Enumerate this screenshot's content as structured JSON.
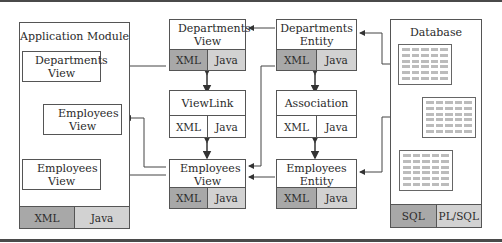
{
  "app_module": {
    "title": "Application Module",
    "departments_view": "Departments View",
    "employees_view_nested": "Employees View",
    "employees_view": "Employees View",
    "footer": [
      "XML",
      "Java"
    ]
  },
  "departments_view": {
    "title": "Departments View",
    "footer": [
      "XML",
      "Java"
    ]
  },
  "viewlink": {
    "title": "ViewLink",
    "footer": [
      "XML",
      "Java"
    ]
  },
  "employees_view": {
    "title": "Employees View",
    "footer": [
      "XML",
      "Java"
    ]
  },
  "departments_eo": {
    "title": "Departments Entity Object",
    "footer": [
      "XML",
      "Java"
    ]
  },
  "association": {
    "title": "Association",
    "footer": [
      "XML",
      "Java"
    ]
  },
  "employees_eo": {
    "title": "Employees Entity Oblect",
    "footer": [
      "XML",
      "Java"
    ]
  },
  "database": {
    "title": "Database",
    "footer": [
      "SQL",
      "PL/SQL"
    ],
    "tables": 3
  },
  "colors": {
    "dark_cell": "#a8a8a8",
    "light_cell": "#d2d2d2",
    "line": "#444444"
  }
}
